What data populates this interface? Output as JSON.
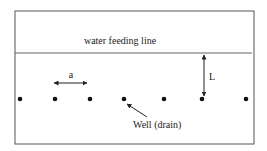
{
  "diagram": {
    "labels": {
      "feeding_line": "water feeding line",
      "spacing": "a",
      "distance": "L",
      "well": "Well (drain)"
    },
    "colors": {
      "line": "#555555",
      "dot": "#111111",
      "text": "#222222"
    },
    "frame": {
      "x": 15,
      "y": 11,
      "width": 239,
      "height": 133
    },
    "feeding_line": {
      "x1": 15,
      "x2": 252,
      "y": 53
    },
    "wells": [
      {
        "x": 20,
        "y": 99
      },
      {
        "x": 55,
        "y": 99
      },
      {
        "x": 90,
        "y": 99
      },
      {
        "x": 124,
        "y": 99
      },
      {
        "x": 164,
        "y": 99
      },
      {
        "x": 202,
        "y": 99
      },
      {
        "x": 246,
        "y": 99
      }
    ],
    "spacing_arrow": {
      "x1": 53,
      "x2": 88,
      "y": 83
    },
    "distance_arrow": {
      "x": 204,
      "y1": 54,
      "y2": 97
    },
    "well_pointer": {
      "from_x": 147,
      "from_y": 117,
      "to_x": 127,
      "to_y": 104
    }
  }
}
